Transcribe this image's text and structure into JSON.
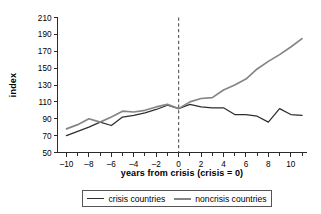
{
  "chart_data": {
    "type": "line",
    "title": "",
    "xlabel": "years from crisis (crisis = 0)",
    "ylabel": "index",
    "xlim": [
      -10.8,
      11.4
    ],
    "ylim": [
      50,
      210
    ],
    "grid": false,
    "legend_position": "bottom",
    "x_ticks": [
      -10,
      -8,
      -6,
      -4,
      -2,
      0,
      2,
      4,
      6,
      8,
      10
    ],
    "x_tick_labels": [
      "–10",
      "–8",
      "–6",
      "–4",
      "–2",
      "0",
      "2",
      "4",
      "6",
      "8",
      "10"
    ],
    "y_ticks": [
      50,
      70,
      90,
      110,
      130,
      150,
      170,
      190,
      210
    ],
    "y_tick_labels": [
      "50",
      "70",
      "90",
      "110",
      "130",
      "150",
      "170",
      "190",
      "210"
    ],
    "annotations": [
      {
        "name": "crisis-reference-line",
        "type": "vline",
        "x": 0,
        "style": "dashed"
      }
    ],
    "x": [
      -10,
      -9,
      -8,
      -7,
      -6,
      -5,
      -4,
      -3,
      -2,
      -1,
      0,
      1,
      2,
      3,
      4,
      5,
      6,
      7,
      8,
      9,
      10,
      11
    ],
    "series": [
      {
        "name": "crisis countries",
        "color": "#2e2e2e",
        "values": [
          70,
          75,
          80,
          86,
          82,
          92,
          94,
          97,
          101,
          106,
          102,
          107,
          104,
          103,
          103,
          95,
          95,
          93,
          86,
          102,
          95,
          94
        ]
      },
      {
        "name": "noncrisis countries",
        "color": "#858585",
        "values": [
          78,
          83,
          90,
          86,
          92,
          99,
          98,
          100,
          104,
          107,
          102,
          110,
          114,
          115,
          124,
          130,
          137,
          149,
          158,
          166,
          175,
          185
        ]
      }
    ]
  },
  "legend": {
    "entries": [
      {
        "label": "crisis countries",
        "swatch": "crisis"
      },
      {
        "label": "noncrisis countries",
        "swatch": "noncrisis"
      }
    ]
  }
}
